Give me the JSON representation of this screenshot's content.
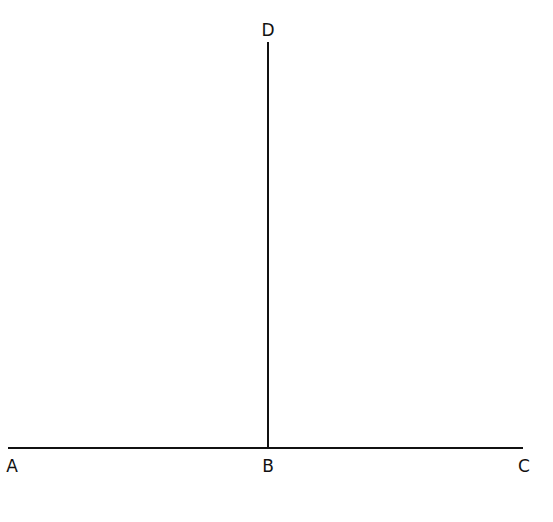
{
  "diagram": {
    "type": "geometry",
    "colors": {
      "line": "#111111",
      "background": "#ffffff"
    },
    "points": [
      {
        "id": "A",
        "label": "A",
        "x": 12,
        "y": 466
      },
      {
        "id": "B",
        "label": "B",
        "x": 268,
        "y": 466
      },
      {
        "id": "C",
        "label": "C",
        "x": 524,
        "y": 466
      },
      {
        "id": "D",
        "label": "D",
        "x": 268,
        "y": 30
      }
    ],
    "segments": [
      {
        "id": "AC",
        "from": "A",
        "to": "C",
        "x1": 8,
        "y1": 448,
        "x2": 523,
        "y2": 448
      },
      {
        "id": "BD",
        "from": "B",
        "to": "D",
        "x1": 268,
        "y1": 42,
        "x2": 268,
        "y2": 448
      }
    ]
  }
}
